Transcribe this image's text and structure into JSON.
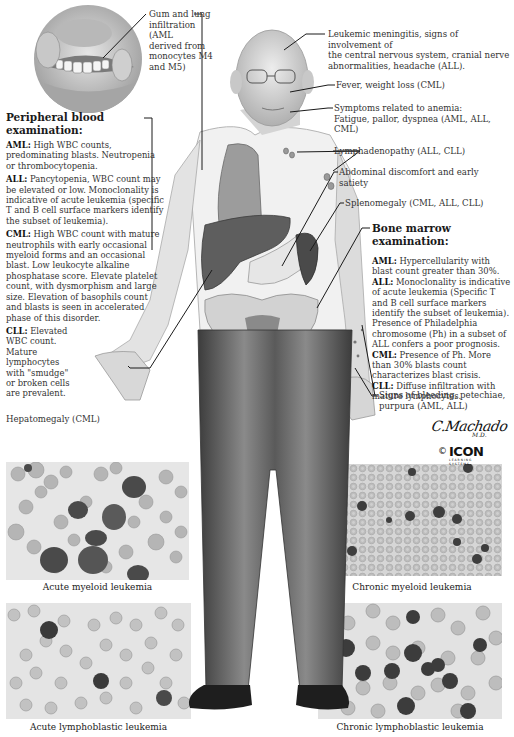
{
  "figure": {
    "colors": {
      "skin": "#d9d9d9",
      "shirt": "#f2f2f2",
      "trousers": "#6e6e6e",
      "trousers_dark": "#3c3c3c",
      "organ_lung": "#9a9a9a",
      "organ_liver": "#5e5e5e",
      "organ_spleen": "#4a4a4a",
      "stomach": "#e6e6e6",
      "pelvis": "#cfcfcf",
      "shoes": "#1e1e1e"
    }
  },
  "inset": {
    "name": "mouth-gum-inset",
    "label": "Gum and lung infiltration (AML derived from monocytes M4 and M5)"
  },
  "labels": {
    "gum": [
      "Gum and lung",
      "infiltration (AML",
      "derived from",
      "monocytes M4",
      "and M5)"
    ],
    "meningitis": [
      "Leukemic meningitis, signs of involvement of",
      "the central nervous system, cranial nerve",
      "abnormalities, headache (ALL)."
    ],
    "fever": "Fever, weight loss (CML)",
    "anemia": [
      "Symptoms related to anemia:",
      "Fatigue, pallor, dyspnea (AML, ALL,",
      "CML)"
    ],
    "lymph": "Lymphadenopathy (ALL, CLL)",
    "abdominal": [
      "Abdominal discomfort and early",
      "satiety"
    ],
    "spleno": "Splenomegaly (CML, ALL, CLL)",
    "hepato": "Hepatomegaly (CML)",
    "bleeding": [
      "Signs of bleeding, petechiae,",
      "purpura (AML, ALL)"
    ]
  },
  "peripheral": {
    "title": "Peripheral blood examination:",
    "items": [
      {
        "tag": "AML:",
        "text": " High WBC counts, predominating blasts. Neutropenia or thrombocytopenia."
      },
      {
        "tag": "ALL:",
        "text": " Pancytopenia, WBC count may be elevated or low. Monoclonality is indicative of acute leukemia (specific T and B cell surface markers identify the subset of leukemia)."
      },
      {
        "tag": "CML:",
        "text": " High WBC count with mature neutrophils with early occasional myeloid forms and an occasional blast. Low leukocyte alkaline phosphatase score. Elevate platelet count, with dysmorphism and large size. Elevation of basophils count and blasts is seen in accelerated phase of this disorder."
      },
      {
        "tag": "CLL:",
        "text": " Elevated WBC count. Mature lymphocytes with \"smudge\" or broken cells are prevalent."
      }
    ]
  },
  "marrow": {
    "title": "Bone marrow examination:",
    "items": [
      {
        "tag": "AML:",
        "text": " Hypercellularity with blast count greater than 30%."
      },
      {
        "tag": "ALL:",
        "text": " Monoclonality is indicative of acute leukemia (Specific T and B cell surface markers identify the subset of leukemia). Presence of Philadelphia chromosome (Ph) in a subset of ALL confers a poor prognosis."
      },
      {
        "tag": "CML:",
        "text": " Presence of Ph. More than 30% blasts count characterizes blast crisis."
      },
      {
        "tag": "CLL:",
        "text": " Diffuse infiltration with mature lymphocytes."
      }
    ]
  },
  "signature": {
    "artist": "C.Machado",
    "degree": "M.D.",
    "copyright": "©",
    "logo": "ICON",
    "logo_sub1": "LEARNING",
    "logo_sub2": "SYSTEMS"
  },
  "micrographs": [
    {
      "caption": "Acute myeloid leukemia",
      "pattern": "aml"
    },
    {
      "caption": "Chronic myeloid leukemia",
      "pattern": "cml"
    },
    {
      "caption": "Acute lymphoblastic leukemia",
      "pattern": "all"
    },
    {
      "caption": "Chronic lymphoblastic leukemia",
      "pattern": "cll"
    }
  ]
}
